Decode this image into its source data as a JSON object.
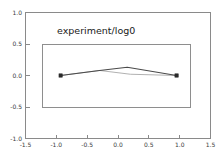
{
  "figure": {
    "background_color": "#ffffff",
    "frame_color": "#8a8a8a"
  },
  "chart_data": {
    "type": "line",
    "title": "experiment/log0",
    "xlabel": "",
    "ylabel": "",
    "xlim": [
      -1.5,
      1.5
    ],
    "ylim": [
      -1.0,
      1.0
    ],
    "grid": false,
    "legend": null,
    "xticks": [
      -1.5,
      -1.0,
      -0.5,
      0.0,
      0.5,
      1.0,
      1.5
    ],
    "xticklabels": [
      "-1.5",
      "-1.0",
      "-0.5",
      "0.0",
      "0.5",
      "1.0",
      "1.5"
    ],
    "yticks": [
      -1.0,
      -0.5,
      0.0,
      0.5,
      1.0
    ],
    "yticklabels": [
      "-1.0",
      "-0.5",
      "0.0",
      "0.5",
      "1.0"
    ],
    "series": [
      {
        "name": "series-a",
        "color": "#4a4a4a",
        "marker": "square",
        "x": [
          -0.93,
          -0.3,
          0.15,
          0.95
        ],
        "y": [
          0.0,
          0.08,
          0.13,
          0.0
        ]
      },
      {
        "name": "series-b",
        "color": "#a8a8a8",
        "marker": "none",
        "x": [
          -0.93,
          -0.3,
          0.2,
          0.95
        ],
        "y": [
          0.0,
          0.08,
          0.02,
          0.0
        ]
      }
    ],
    "markers": [
      {
        "x": -0.93,
        "y": 0.0
      },
      {
        "x": 0.95,
        "y": 0.0
      }
    ],
    "annotations": [
      {
        "name": "bounding-rectangle",
        "x0": -1.22,
        "y0": -0.5,
        "x1": 1.18,
        "y1": 0.5,
        "color": "#8e8e8e"
      }
    ]
  }
}
